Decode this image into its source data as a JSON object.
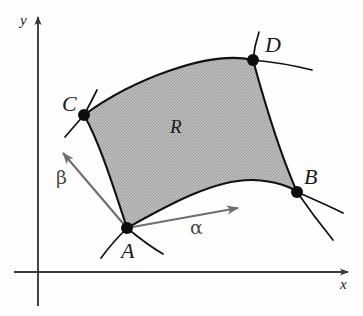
{
  "figure": {
    "background_color": "#fefefe",
    "region_fill_color": "#b3b3b3",
    "curve_color": "#111111",
    "axis_color": "#3a3a3a",
    "vector_color": "#6e6e6e"
  },
  "axes": {
    "x_label": "x",
    "y_label": "y",
    "origin": {
      "x": 38,
      "y": 272
    },
    "x_axis_end": {
      "x": 350,
      "y": 272
    },
    "y_axis_end": {
      "x": 38,
      "y": 15
    }
  },
  "region": {
    "label": "R",
    "label_position": {
      "x": 176,
      "y": 127
    }
  },
  "points": [
    {
      "name": "A",
      "label": "A",
      "x": 127,
      "y": 228,
      "label_x": 128,
      "label_y": 252
    },
    {
      "name": "B",
      "label": "B",
      "x": 297,
      "y": 192,
      "label_x": 311,
      "label_y": 178
    },
    {
      "name": "C",
      "label": "C",
      "x": 84,
      "y": 115,
      "label_x": 70,
      "label_y": 104
    },
    {
      "name": "D",
      "label": "D",
      "x": 253,
      "y": 60,
      "label_x": 272,
      "label_y": 46
    }
  ],
  "vectors": [
    {
      "name": "alpha",
      "label": "α",
      "from": {
        "x": 127,
        "y": 228
      },
      "to": {
        "x": 245,
        "y": 206
      },
      "label_x": 197,
      "label_y": 228
    },
    {
      "name": "beta",
      "label": "β",
      "from": {
        "x": 127,
        "y": 228
      },
      "to": {
        "x": 58,
        "y": 147
      },
      "label_x": 62,
      "label_y": 178
    }
  ],
  "boundary_curves": [
    {
      "name": "curve-a-b",
      "from": "A",
      "to": "B"
    },
    {
      "name": "curve-b-d",
      "from": "B",
      "to": "D"
    },
    {
      "name": "curve-d-c",
      "from": "D",
      "to": "C"
    },
    {
      "name": "curve-c-a",
      "from": "C",
      "to": "A"
    }
  ]
}
